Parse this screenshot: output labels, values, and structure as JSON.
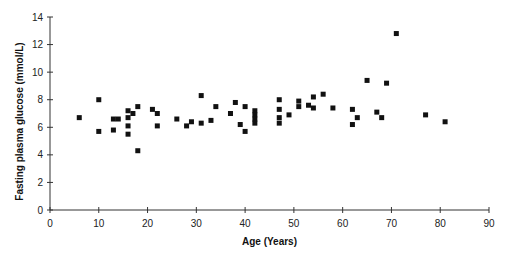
{
  "chart_data": {
    "type": "scatter",
    "title": "",
    "xlabel": "Age (Years)",
    "ylabel": "Fasting plasma glucose  (mmol/L)",
    "xlim": [
      0,
      90
    ],
    "ylim": [
      0,
      14
    ],
    "xticks": [
      0,
      10,
      20,
      30,
      40,
      50,
      60,
      70,
      80,
      90
    ],
    "yticks": [
      0,
      2,
      4,
      6,
      8,
      10,
      12,
      14
    ],
    "grid": false,
    "legend": null,
    "marker": "square",
    "marker_color": "#111111",
    "series": [
      {
        "name": "Fasting plasma glucose",
        "points": [
          [
            6,
            6.7
          ],
          [
            10,
            8.0
          ],
          [
            10,
            5.7
          ],
          [
            13,
            6.6
          ],
          [
            13,
            5.8
          ],
          [
            14,
            6.6
          ],
          [
            16,
            7.2
          ],
          [
            16,
            6.7
          ],
          [
            16,
            6.1
          ],
          [
            16,
            5.5
          ],
          [
            17,
            7.0
          ],
          [
            18,
            7.5
          ],
          [
            18,
            4.3
          ],
          [
            21,
            7.3
          ],
          [
            22,
            7.0
          ],
          [
            22,
            6.1
          ],
          [
            26,
            6.6
          ],
          [
            28,
            6.1
          ],
          [
            29,
            6.4
          ],
          [
            31,
            8.3
          ],
          [
            31,
            6.3
          ],
          [
            33,
            6.5
          ],
          [
            34,
            7.5
          ],
          [
            37,
            7.0
          ],
          [
            38,
            7.8
          ],
          [
            39,
            6.2
          ],
          [
            40,
            7.5
          ],
          [
            40,
            5.7
          ],
          [
            42,
            7.2
          ],
          [
            42,
            6.9
          ],
          [
            42,
            6.6
          ],
          [
            42,
            6.3
          ],
          [
            47,
            8.0
          ],
          [
            47,
            7.3
          ],
          [
            47,
            6.7
          ],
          [
            47,
            6.3
          ],
          [
            49,
            6.9
          ],
          [
            51,
            7.9
          ],
          [
            51,
            7.5
          ],
          [
            53,
            7.6
          ],
          [
            54,
            8.2
          ],
          [
            54,
            7.4
          ],
          [
            56,
            8.4
          ],
          [
            58,
            7.4
          ],
          [
            62,
            7.3
          ],
          [
            62,
            6.2
          ],
          [
            63,
            6.7
          ],
          [
            65,
            9.4
          ],
          [
            67,
            7.1
          ],
          [
            68,
            6.7
          ],
          [
            69,
            9.2
          ],
          [
            71,
            12.8
          ],
          [
            77,
            6.9
          ],
          [
            81,
            6.4
          ]
        ]
      }
    ]
  }
}
